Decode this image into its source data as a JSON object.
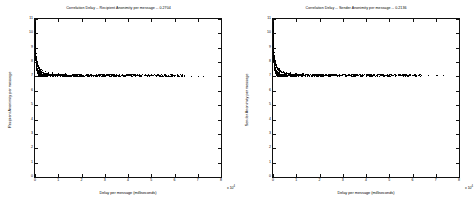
{
  "figure": {
    "background": "#ffffff",
    "axis_color": "#111111",
    "marker_color": "#000000"
  },
  "panels": [
    {
      "id": "left",
      "title": "Correlation Delay -- Recipient Anonimity per message -- 0.2704",
      "xlabel": "Delay per message (milliseconds)",
      "ylabel": "Recipient Anonimity per message",
      "exponent": "x 10",
      "exponent_sup": "4"
    },
    {
      "id": "right",
      "title": "Correlation Delay -- Sender Anonimity per message -- 0.2136",
      "xlabel": "Delay per message (milliseconds)",
      "ylabel": "Sender Anonimity per message",
      "exponent": "x 10",
      "exponent_sup": "4"
    }
  ],
  "chart_data": [
    {
      "type": "scatter",
      "panel": "left",
      "title": "Correlation Delay -- Recipient Anonimity per message -- 0.2704",
      "xlabel": "Delay per message (milliseconds)",
      "ylabel": "Recipient Anonimity per message",
      "correlation": 0.2704,
      "xlim": [
        0,
        80000
      ],
      "ylim": [
        0,
        11
      ],
      "x_multiplier": 10000,
      "xticks": [
        0,
        1,
        2,
        3,
        4,
        5,
        6,
        7,
        8
      ],
      "xticklabels": [
        "0",
        "1",
        "2",
        "3",
        "4",
        "5",
        "6",
        "7",
        "8"
      ],
      "yticks": [
        0,
        1,
        2,
        3,
        4,
        5,
        6,
        7,
        8,
        9,
        10,
        11
      ],
      "yticklabels": [
        "0",
        "1",
        "2",
        "3",
        "4",
        "5",
        "6",
        "7",
        "8",
        "9",
        "10",
        "11"
      ],
      "grid": false,
      "legend": null,
      "marker": "+",
      "description": "Dense hyperbolic decay cluster against left axis falling from y~11 to an asymptote near y~7, then a long sparse horizontal tail extending right to x~7.2e4.",
      "points": [
        [
          120,
          10.9
        ],
        [
          140,
          10.6
        ],
        [
          150,
          10.3
        ],
        [
          160,
          10.1
        ],
        [
          170,
          9.9
        ],
        [
          180,
          9.7
        ],
        [
          190,
          9.5
        ],
        [
          200,
          9.4
        ],
        [
          205,
          9.2
        ],
        [
          215,
          9.1
        ],
        [
          225,
          9.0
        ],
        [
          235,
          8.95
        ],
        [
          245,
          8.9
        ],
        [
          255,
          8.85
        ],
        [
          265,
          8.8
        ],
        [
          275,
          8.75
        ],
        [
          285,
          8.7
        ],
        [
          295,
          8.68
        ],
        [
          305,
          8.65
        ],
        [
          315,
          8.6
        ],
        [
          325,
          8.58
        ],
        [
          340,
          8.55
        ],
        [
          355,
          8.5
        ],
        [
          370,
          8.48
        ],
        [
          385,
          8.45
        ],
        [
          400,
          8.42
        ],
        [
          420,
          8.4
        ],
        [
          440,
          8.38
        ],
        [
          460,
          8.35
        ],
        [
          480,
          8.3
        ],
        [
          500,
          8.28
        ],
        [
          520,
          8.25
        ],
        [
          545,
          8.22
        ],
        [
          570,
          8.2
        ],
        [
          595,
          8.18
        ],
        [
          620,
          8.15
        ],
        [
          650,
          8.12
        ],
        [
          680,
          8.1
        ],
        [
          710,
          8.05
        ],
        [
          740,
          8.02
        ],
        [
          775,
          8.0
        ],
        [
          810,
          7.97
        ],
        [
          845,
          7.95
        ],
        [
          885,
          7.92
        ],
        [
          925,
          7.9
        ],
        [
          965,
          7.88
        ],
        [
          1010,
          7.85
        ],
        [
          1055,
          7.82
        ],
        [
          1100,
          7.8
        ],
        [
          1150,
          7.78
        ],
        [
          1200,
          7.75
        ],
        [
          1255,
          7.72
        ],
        [
          1310,
          7.7
        ],
        [
          1370,
          7.68
        ],
        [
          1430,
          7.65
        ],
        [
          1495,
          7.62
        ],
        [
          1560,
          7.6
        ],
        [
          1630,
          7.58
        ],
        [
          1700,
          7.55
        ],
        [
          1780,
          7.52
        ],
        [
          1860,
          7.5
        ],
        [
          1945,
          7.48
        ],
        [
          2030,
          7.45
        ],
        [
          2125,
          7.43
        ],
        [
          2220,
          7.41
        ],
        [
          2320,
          7.39
        ],
        [
          2425,
          7.37
        ],
        [
          2535,
          7.35
        ],
        [
          2650,
          7.34
        ],
        [
          2770,
          7.32
        ],
        [
          2895,
          7.31
        ],
        [
          3025,
          7.3
        ],
        [
          3160,
          7.28
        ],
        [
          3300,
          7.27
        ],
        [
          3450,
          7.26
        ],
        [
          3605,
          7.25
        ],
        [
          3765,
          7.24
        ],
        [
          3935,
          7.23
        ],
        [
          4110,
          7.22
        ],
        [
          4295,
          7.21
        ],
        [
          4490,
          7.2
        ],
        [
          4690,
          7.2
        ],
        [
          4900,
          7.19
        ],
        [
          5120,
          7.18
        ],
        [
          5350,
          7.18
        ],
        [
          5590,
          7.17
        ],
        [
          5840,
          7.17
        ],
        [
          6100,
          7.16
        ],
        [
          6375,
          7.16
        ],
        [
          6660,
          7.15
        ],
        [
          6960,
          7.15
        ],
        [
          7270,
          7.14
        ],
        [
          7595,
          7.14
        ],
        [
          7935,
          7.13
        ],
        [
          8290,
          7.13
        ],
        [
          8660,
          7.13
        ],
        [
          9050,
          7.12
        ],
        [
          9455,
          7.12
        ],
        [
          9875,
          7.12
        ],
        [
          10320,
          7.11
        ],
        [
          10780,
          7.11
        ],
        [
          11260,
          7.11
        ],
        [
          11760,
          7.1
        ],
        [
          12290,
          7.1
        ],
        [
          12840,
          7.1
        ],
        [
          13410,
          7.1
        ],
        [
          14010,
          7.09
        ],
        [
          14630,
          7.09
        ],
        [
          15290,
          7.09
        ],
        [
          15970,
          7.09
        ],
        [
          16680,
          7.08
        ],
        [
          17420,
          7.08
        ],
        [
          18200,
          7.08
        ],
        [
          19010,
          7.08
        ],
        [
          19850,
          7.08
        ],
        [
          20740,
          7.07
        ],
        [
          21660,
          7.07
        ],
        [
          22620,
          7.07
        ],
        [
          23630,
          7.07
        ],
        [
          24680,
          7.07
        ],
        [
          25780,
          7.06
        ],
        [
          26920,
          7.06
        ],
        [
          28120,
          7.06
        ],
        [
          29370,
          7.06
        ],
        [
          30680,
          7.06
        ],
        [
          32040,
          7.05
        ],
        [
          33460,
          7.05
        ],
        [
          34950,
          7.05
        ],
        [
          36500,
          7.05
        ],
        [
          38120,
          7.05
        ],
        [
          39820,
          7.05
        ],
        [
          41590,
          7.04
        ],
        [
          43440,
          7.04
        ],
        [
          45370,
          7.04
        ],
        [
          47390,
          7.04
        ],
        [
          49500,
          7.04
        ],
        [
          51700,
          7.04
        ],
        [
          54000,
          7.03
        ],
        [
          56400,
          7.03
        ],
        [
          58900,
          7.03
        ],
        [
          61500,
          7.03
        ],
        [
          64300,
          7.03
        ],
        [
          67200,
          7.02
        ],
        [
          70200,
          7.02
        ],
        [
          72400,
          7.02
        ],
        [
          320,
          9.3
        ],
        [
          380,
          8.9
        ],
        [
          450,
          8.6
        ],
        [
          560,
          8.4
        ],
        [
          700,
          8.2
        ],
        [
          900,
          8.05
        ],
        [
          1150,
          7.9
        ],
        [
          1500,
          7.78
        ],
        [
          2000,
          7.6
        ],
        [
          2600,
          7.5
        ],
        [
          3400,
          7.4
        ],
        [
          4400,
          7.34
        ],
        [
          5800,
          7.28
        ],
        [
          7600,
          7.24
        ],
        [
          10000,
          7.2
        ],
        [
          13000,
          7.17
        ],
        [
          17000,
          7.14
        ],
        [
          22000,
          7.12
        ],
        [
          29000,
          7.1
        ],
        [
          38000,
          7.08
        ],
        [
          50000,
          7.06
        ]
      ]
    },
    {
      "type": "scatter",
      "panel": "right",
      "title": "Correlation Delay -- Sender Anonimity per message -- 0.2136",
      "xlabel": "Delay per message (milliseconds)",
      "ylabel": "Sender Anonimity per message",
      "correlation": 0.2136,
      "xlim": [
        0,
        80000
      ],
      "ylim": [
        0,
        11
      ],
      "x_multiplier": 10000,
      "xticks": [
        0,
        1,
        2,
        3,
        4,
        5,
        6,
        7,
        8
      ],
      "xticklabels": [
        "0",
        "1",
        "2",
        "3",
        "4",
        "5",
        "6",
        "7",
        "8"
      ],
      "yticks": [
        0,
        1,
        2,
        3,
        4,
        5,
        6,
        7,
        8,
        9,
        10,
        11
      ],
      "yticklabels": [
        "0",
        "1",
        "2",
        "3",
        "4",
        "5",
        "6",
        "7",
        "8",
        "9",
        "10",
        "11"
      ],
      "grid": false,
      "legend": null,
      "marker": "+",
      "description": "Dense hyperbolic decay cluster against left axis falling from y~11 to an asymptote near y~7, then a long sparse horizontal tail extending right to x~7.3e4.",
      "points": [
        [
          115,
          10.95
        ],
        [
          130,
          10.7
        ],
        [
          145,
          10.4
        ],
        [
          155,
          10.15
        ],
        [
          165,
          9.95
        ],
        [
          175,
          9.75
        ],
        [
          185,
          9.6
        ],
        [
          195,
          9.45
        ],
        [
          205,
          9.3
        ],
        [
          215,
          9.18
        ],
        [
          225,
          9.05
        ],
        [
          235,
          8.98
        ],
        [
          248,
          8.92
        ],
        [
          260,
          8.86
        ],
        [
          272,
          8.8
        ],
        [
          285,
          8.76
        ],
        [
          298,
          8.72
        ],
        [
          312,
          8.68
        ],
        [
          326,
          8.64
        ],
        [
          340,
          8.6
        ],
        [
          356,
          8.56
        ],
        [
          372,
          8.52
        ],
        [
          390,
          8.48
        ],
        [
          408,
          8.45
        ],
        [
          428,
          8.42
        ],
        [
          448,
          8.39
        ],
        [
          470,
          8.36
        ],
        [
          492,
          8.32
        ],
        [
          516,
          8.29
        ],
        [
          540,
          8.26
        ],
        [
          566,
          8.23
        ],
        [
          594,
          8.2
        ],
        [
          622,
          8.17
        ],
        [
          652,
          8.14
        ],
        [
          684,
          8.11
        ],
        [
          718,
          8.08
        ],
        [
          752,
          8.05
        ],
        [
          790,
          8.02
        ],
        [
          828,
          7.99
        ],
        [
          868,
          7.96
        ],
        [
          910,
          7.93
        ],
        [
          955,
          7.9
        ],
        [
          1000,
          7.88
        ],
        [
          1050,
          7.85
        ],
        [
          1100,
          7.82
        ],
        [
          1155,
          7.8
        ],
        [
          1212,
          7.77
        ],
        [
          1272,
          7.75
        ],
        [
          1335,
          7.72
        ],
        [
          1400,
          7.7
        ],
        [
          1470,
          7.68
        ],
        [
          1545,
          7.65
        ],
        [
          1620,
          7.63
        ],
        [
          1700,
          7.6
        ],
        [
          1785,
          7.58
        ],
        [
          1875,
          7.56
        ],
        [
          1970,
          7.54
        ],
        [
          2070,
          7.51
        ],
        [
          2175,
          7.49
        ],
        [
          2285,
          7.47
        ],
        [
          2400,
          7.45
        ],
        [
          2520,
          7.43
        ],
        [
          2650,
          7.41
        ],
        [
          2785,
          7.39
        ],
        [
          2925,
          7.38
        ],
        [
          3075,
          7.36
        ],
        [
          3230,
          7.34
        ],
        [
          3395,
          7.33
        ],
        [
          3570,
          7.31
        ],
        [
          3750,
          7.3
        ],
        [
          3945,
          7.29
        ],
        [
          4145,
          7.27
        ],
        [
          4360,
          7.26
        ],
        [
          4585,
          7.25
        ],
        [
          4820,
          7.24
        ],
        [
          5070,
          7.23
        ],
        [
          5330,
          7.22
        ],
        [
          5610,
          7.21
        ],
        [
          5900,
          7.2
        ],
        [
          6205,
          7.19
        ],
        [
          6525,
          7.19
        ],
        [
          6865,
          7.18
        ],
        [
          7220,
          7.17
        ],
        [
          7595,
          7.17
        ],
        [
          7990,
          7.16
        ],
        [
          8405,
          7.16
        ],
        [
          8840,
          7.15
        ],
        [
          9300,
          7.15
        ],
        [
          9785,
          7.14
        ],
        [
          10290,
          7.14
        ],
        [
          10830,
          7.13
        ],
        [
          11390,
          7.13
        ],
        [
          11980,
          7.13
        ],
        [
          12600,
          7.12
        ],
        [
          13260,
          7.12
        ],
        [
          13950,
          7.12
        ],
        [
          14670,
          7.11
        ],
        [
          15440,
          7.11
        ],
        [
          16240,
          7.11
        ],
        [
          17080,
          7.1
        ],
        [
          17970,
          7.1
        ],
        [
          18900,
          7.1
        ],
        [
          19880,
          7.1
        ],
        [
          20910,
          7.09
        ],
        [
          22000,
          7.09
        ],
        [
          23140,
          7.09
        ],
        [
          24340,
          7.09
        ],
        [
          25600,
          7.08
        ],
        [
          26930,
          7.08
        ],
        [
          28330,
          7.08
        ],
        [
          29800,
          7.08
        ],
        [
          31350,
          7.08
        ],
        [
          32980,
          7.07
        ],
        [
          34690,
          7.07
        ],
        [
          36490,
          7.07
        ],
        [
          38380,
          7.07
        ],
        [
          40380,
          7.07
        ],
        [
          42470,
          7.06
        ],
        [
          44680,
          7.06
        ],
        [
          47000,
          7.06
        ],
        [
          49440,
          7.06
        ],
        [
          52000,
          7.06
        ],
        [
          54700,
          7.05
        ],
        [
          57540,
          7.05
        ],
        [
          60500,
          7.05
        ],
        [
          63700,
          7.05
        ],
        [
          67000,
          7.05
        ],
        [
          70500,
          7.04
        ],
        [
          73200,
          7.04
        ],
        [
          300,
          9.35
        ],
        [
          360,
          8.95
        ],
        [
          430,
          8.65
        ],
        [
          540,
          8.45
        ],
        [
          680,
          8.25
        ],
        [
          880,
          8.08
        ],
        [
          1130,
          7.93
        ],
        [
          1480,
          7.8
        ],
        [
          1950,
          7.64
        ],
        [
          2550,
          7.52
        ],
        [
          3350,
          7.42
        ],
        [
          4350,
          7.35
        ],
        [
          5700,
          7.29
        ],
        [
          7500,
          7.25
        ],
        [
          9900,
          7.21
        ],
        [
          12900,
          7.18
        ],
        [
          16900,
          7.15
        ],
        [
          21800,
          7.13
        ],
        [
          28700,
          7.11
        ],
        [
          37600,
          7.09
        ],
        [
          49500,
          7.07
        ]
      ]
    }
  ]
}
